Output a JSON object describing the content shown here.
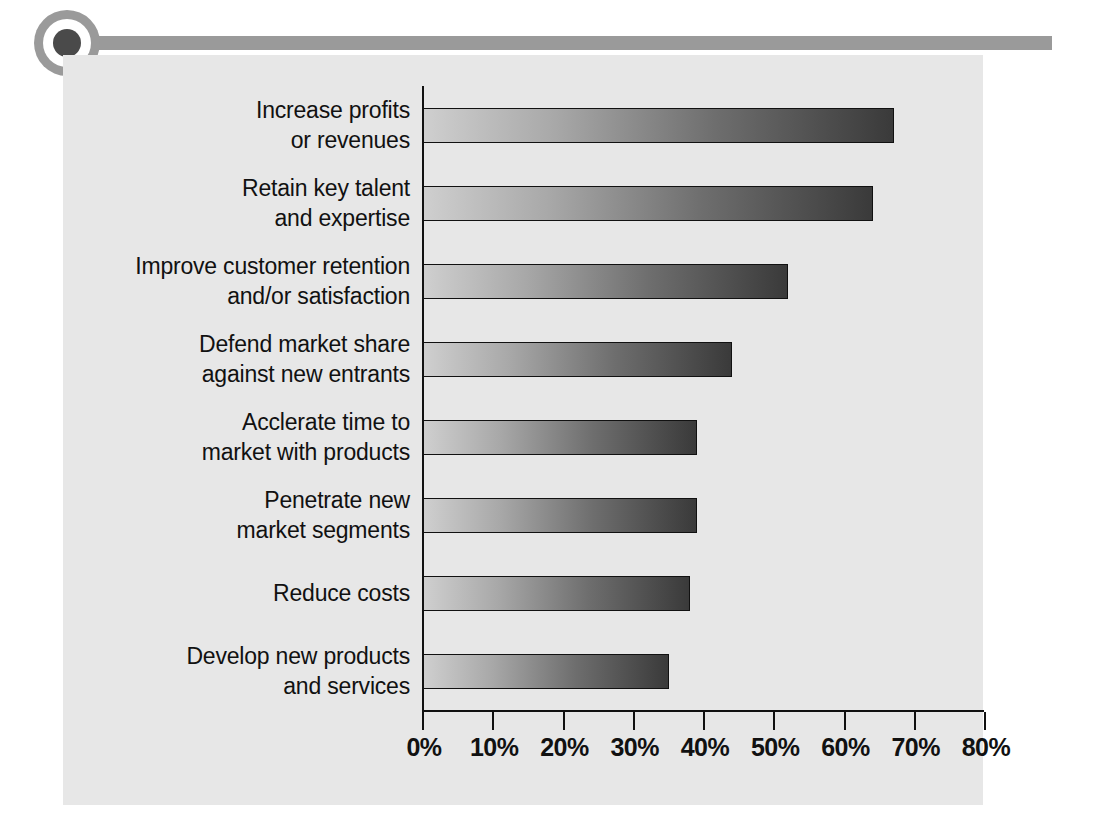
{
  "decoration": {
    "bullet_icon": "filled-circle-ring-icon",
    "rule": "horizontal-rule"
  },
  "chart_data": {
    "type": "bar",
    "orientation": "horizontal",
    "title": "",
    "subtitle": "",
    "xlabel": "",
    "ylabel": "",
    "xlim": [
      0,
      80
    ],
    "grid": false,
    "legend": null,
    "tick_labels": [
      "0%",
      "10%",
      "20%",
      "30%",
      "40%",
      "50%",
      "60%",
      "70%",
      "80%"
    ],
    "tick_values": [
      0,
      10,
      20,
      30,
      40,
      50,
      60,
      70,
      80
    ],
    "categories": [
      "Increase profits or revenues",
      "Retain key talent and expertise",
      "Improve customer retention and/or satisfaction",
      "Defend market share against new entrants",
      "Acclerate time to market with products",
      "Penetrate new market segments",
      "Reduce costs",
      "Develop new products and services"
    ],
    "category_lines": [
      [
        "Increase profits",
        "or revenues"
      ],
      [
        "Retain key talent",
        "and expertise"
      ],
      [
        "Improve customer retention",
        "and/or satisfaction"
      ],
      [
        "Defend market share",
        "against new entrants"
      ],
      [
        "Acclerate time to",
        "market with products"
      ],
      [
        "Penetrate new",
        "market segments"
      ],
      [
        "Reduce costs",
        ""
      ],
      [
        "Develop new products",
        "and services"
      ]
    ],
    "values": [
      67,
      64,
      52,
      44,
      39,
      39,
      38,
      35
    ],
    "bar_gradient": {
      "from": "#cfcfcf",
      "to": "#3a3a3a"
    },
    "colors": {
      "panel_background": "#e7e7e7",
      "page_background": "#ffffff",
      "axis": "#111111",
      "text": "#111111",
      "decoration": "#9a9a9a"
    }
  }
}
